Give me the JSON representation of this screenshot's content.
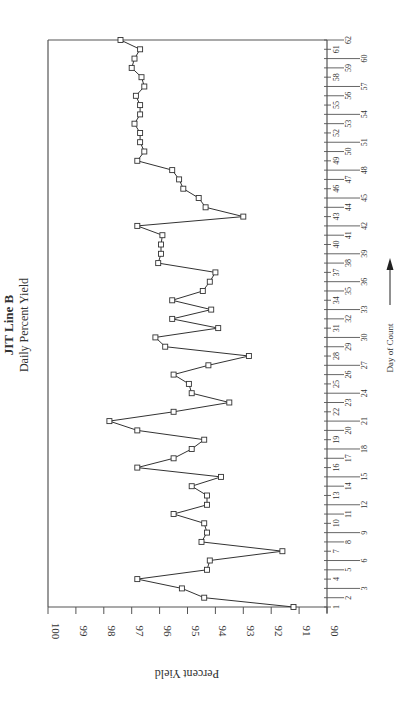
{
  "chart_data": {
    "type": "line",
    "title": "JIT Line B",
    "subtitle": "Daily Percent Yield",
    "xlabel": "Day of Count",
    "ylabel": "Percent Yield",
    "orientation": "rotated-90-ccw",
    "marker": "square",
    "grid": false,
    "legend": null,
    "ylim": [
      90,
      100
    ],
    "yticks": [
      100,
      99,
      98,
      97,
      96,
      95,
      94,
      93,
      92,
      91,
      90
    ],
    "xlim": [
      1,
      62
    ],
    "x": [
      1,
      2,
      3,
      4,
      5,
      6,
      7,
      8,
      9,
      10,
      11,
      12,
      13,
      14,
      15,
      16,
      17,
      18,
      19,
      20,
      21,
      22,
      23,
      24,
      25,
      26,
      27,
      28,
      29,
      30,
      31,
      32,
      33,
      34,
      35,
      36,
      37,
      38,
      39,
      40,
      41,
      42,
      43,
      44,
      45,
      46,
      47,
      48,
      49,
      50,
      51,
      52,
      53,
      54,
      55,
      56,
      57,
      58,
      59,
      60,
      61,
      62
    ],
    "values": [
      91.2,
      94.4,
      95.2,
      96.8,
      94.3,
      94.2,
      91.6,
      94.5,
      94.3,
      94.4,
      95.5,
      94.3,
      94.3,
      94.85,
      93.8,
      96.8,
      95.5,
      94.85,
      94.4,
      96.8,
      97.8,
      95.5,
      93.5,
      94.85,
      94.95,
      95.5,
      94.25,
      92.8,
      95.8,
      96.15,
      93.9,
      95.55,
      94.15,
      95.55,
      94.45,
      94.2,
      94.0,
      96.05,
      95.95,
      95.95,
      95.9,
      96.8,
      93.0,
      94.35,
      94.6,
      95.15,
      95.3,
      95.55,
      96.8,
      96.55,
      96.7,
      96.7,
      96.9,
      96.7,
      96.7,
      96.85,
      96.55,
      96.65,
      97.0,
      96.9,
      96.7,
      97.4
    ]
  },
  "layout": {
    "frame_left": 48,
    "frame_right": 327,
    "frame_top": 40,
    "frame_bottom": 607,
    "line_color": "#333333",
    "axis_color": "#555555",
    "marker_size": 5
  }
}
